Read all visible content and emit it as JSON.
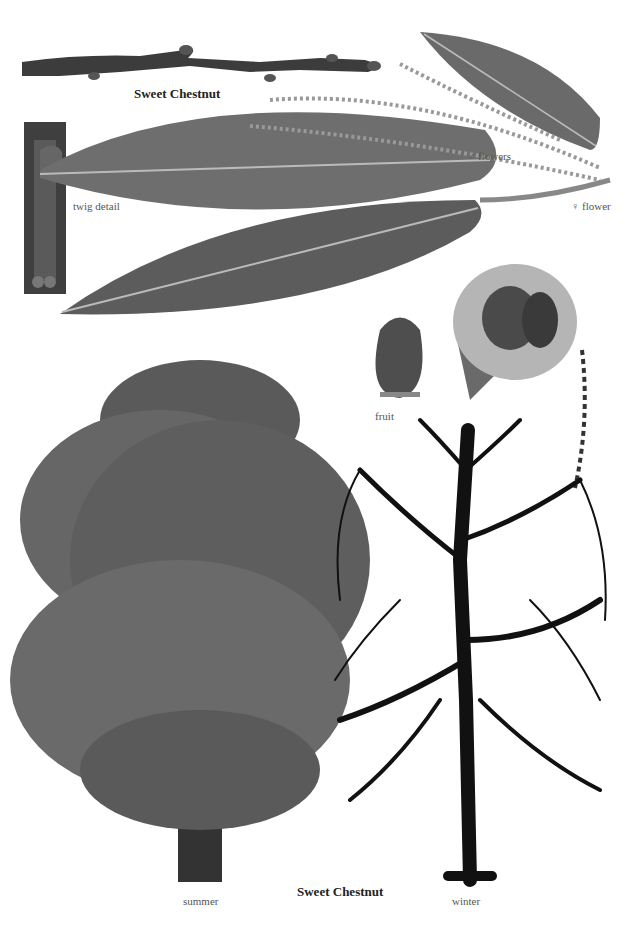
{
  "plate": {
    "top_title": "Sweet Chestnut",
    "bottom_title": "Sweet Chestnut",
    "labels": {
      "twig_detail": "twig detail",
      "male_flowers": "♂ flowers",
      "female_flower": "♀ flower",
      "fruit": "fruit",
      "summer": "summer",
      "winter": "winter"
    }
  },
  "colors": {
    "background": "#ffffff",
    "leaf": "#6e6e6e",
    "leaf_dark": "#4a4a4a",
    "twig": "#3c3c3c",
    "burr": "#b5b5b5",
    "tree_summer": "#5a5a5a",
    "tree_winter": "#111111"
  }
}
